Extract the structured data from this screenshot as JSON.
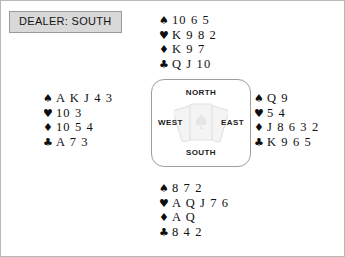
{
  "dealer": {
    "label": "DEALER: SOUTH"
  },
  "compass": {
    "north": "NORTH",
    "south": "SOUTH",
    "west": "WEST",
    "east": "EAST",
    "watermark": "playing-cards-fan-icon"
  },
  "suits": {
    "spade": "♠",
    "heart": "♥",
    "diamond": "♦",
    "club": "♣"
  },
  "hands": {
    "north": {
      "position": "North",
      "spades": "10 6 5",
      "hearts": "K 9 8 2",
      "diamonds": "K 9 7",
      "clubs": "Q J 10"
    },
    "west": {
      "position": "West",
      "spades": "A K J 4 3",
      "hearts": "10 3",
      "diamonds": "10 5 4",
      "clubs": "A 7 3"
    },
    "east": {
      "position": "East",
      "spades": "Q 9",
      "hearts": "5 4",
      "diamonds": "J 8 6 3 2",
      "clubs": "K 9 6 5"
    },
    "south": {
      "position": "South",
      "spades": "8 7 2",
      "hearts": "A Q J 7 6",
      "diamonds": "A Q",
      "clubs": "8 4 2"
    }
  },
  "colors": {
    "suit_color": "#0d0d0d",
    "card_text": "#111111",
    "dealer_fill": "#d9d9d9",
    "dealer_border": "#9a9a9a",
    "compass_border": "#9e9e9e",
    "page_border": "#b8b8b8"
  }
}
